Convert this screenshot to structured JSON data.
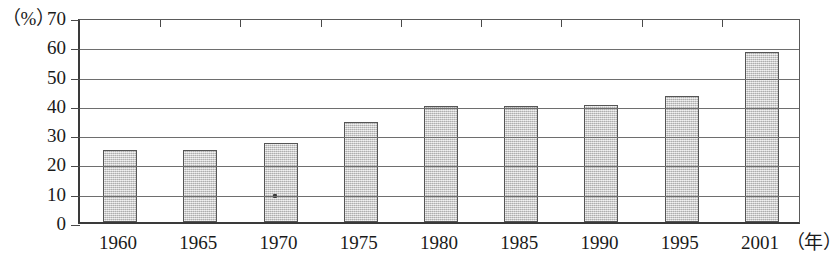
{
  "chart_data": {
    "type": "bar",
    "title": "",
    "xlabel": "年",
    "ylabel": "%",
    "y_unit_label": "（%）",
    "x_unit_label": "（年）",
    "categories": [
      "1960",
      "1965",
      "1970",
      "1975",
      "1980",
      "1985",
      "1990",
      "1995",
      "2001"
    ],
    "values": [
      24.5,
      24.5,
      27,
      34,
      39.5,
      39.5,
      40,
      43,
      58
    ],
    "ylim": [
      0,
      70
    ],
    "y_ticks": [
      70,
      60,
      50,
      40,
      30,
      20,
      10,
      0
    ],
    "y_tick_labels": [
      "70",
      "60",
      "50",
      "40",
      "30",
      "20",
      "10",
      "0"
    ],
    "grid": true,
    "grid_axis": "y",
    "legend": "none",
    "bar_color": "#c9c9c9",
    "bar_edge_color": "#555555",
    "axis_color": "#3a3a3a",
    "gridline_color": "#6e6e6e"
  }
}
